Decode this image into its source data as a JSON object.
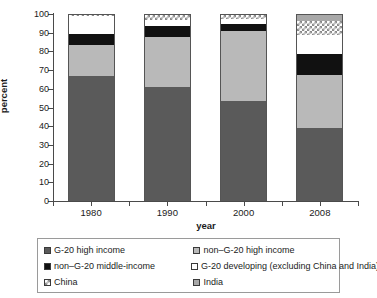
{
  "chart_data": {
    "type": "bar",
    "subtype": "stacked-bar-100-percent",
    "title": "",
    "xlabel": "year",
    "ylabel": "percent",
    "categories": [
      "1980",
      "1990",
      "2000",
      "2008"
    ],
    "ylim": [
      0,
      100
    ],
    "yticks": [
      0,
      10,
      20,
      30,
      40,
      50,
      60,
      70,
      80,
      90,
      100
    ],
    "ytick_labels": [
      "0",
      "10",
      "20",
      "30",
      "40",
      "50",
      "60",
      "70",
      "80",
      "90",
      "100"
    ],
    "grid": false,
    "legend_position": "below",
    "stack_order_bottom_to_top": [
      "G-20 high income",
      "non–G-20 high income",
      "non–G-20 middle-income",
      "G-20 developing (excluding China and India)",
      "China",
      "India"
    ],
    "series": [
      {
        "name": "G-20 high income",
        "swatch": "g20high",
        "color": "#5a5a5a",
        "values": [
          67.5,
          61.5,
          54.0,
          39.5
        ]
      },
      {
        "name": "non–G-20 high income",
        "swatch": "nong20high",
        "color": "#b9b9b9",
        "values": [
          16.3,
          27.0,
          37.5,
          28.5
        ]
      },
      {
        "name": "non–G-20 middle-income",
        "swatch": "nong20mid",
        "color": "#111111",
        "values": [
          6.2,
          5.7,
          3.5,
          11.0
        ]
      },
      {
        "name": "G-20 developing (excluding China and India)",
        "swatch": "g20dev",
        "color": "#ffffff",
        "values": [
          9.5,
          3.0,
          3.0,
          10.5
        ]
      },
      {
        "name": "China",
        "swatch": "china",
        "color": "#ffffff",
        "pattern": "checkered",
        "values": [
          0.5,
          2.8,
          2.0,
          7.5
        ]
      },
      {
        "name": "India",
        "swatch": "india",
        "color": "#a8a8a8",
        "values": [
          0.0,
          0.0,
          0.0,
          3.0
        ]
      }
    ],
    "legend": [
      {
        "label": "G-20 high income",
        "swatch": "g20high"
      },
      {
        "label": "non–G-20 high income",
        "swatch": "nong20high"
      },
      {
        "label": "non–G-20 middle-income",
        "swatch": "nong20mid"
      },
      {
        "label": "G-20 developing (excluding China and India)",
        "swatch": "g20dev"
      },
      {
        "label": "China",
        "swatch": "china"
      },
      {
        "label": "India",
        "swatch": "india"
      }
    ]
  }
}
